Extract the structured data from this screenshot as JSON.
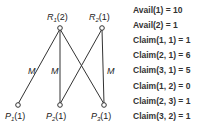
{
  "graph": {
    "resources": [
      {
        "name": "R",
        "index": "1",
        "units": "(2)",
        "x": 60,
        "y": 28
      },
      {
        "name": "R",
        "index": "2",
        "units": "(1)",
        "x": 102,
        "y": 28
      }
    ],
    "processes": [
      {
        "name": "P",
        "index": "1",
        "units": "(1)",
        "x": 18,
        "y": 105
      },
      {
        "name": "P",
        "index": "2",
        "units": "(1)",
        "x": 60,
        "y": 105
      },
      {
        "name": "P",
        "index": "3",
        "units": "(1)",
        "x": 104,
        "y": 105
      }
    ],
    "edges": [
      {
        "from": "R1",
        "to": "P1",
        "label": "M"
      },
      {
        "from": "R1",
        "to": "P2",
        "label": "M"
      },
      {
        "from": "R1",
        "to": "P3",
        "label": ""
      },
      {
        "from": "R2",
        "to": "P2",
        "label": ""
      },
      {
        "from": "R2",
        "to": "P3",
        "label": "M"
      }
    ]
  },
  "equations": [
    {
      "text": "Avail(1)     = 10"
    },
    {
      "text": "Avail(2)     = 1"
    },
    {
      "text": "Claim(1, 1) = 1"
    },
    {
      "text": "Claim(2, 1) = 6"
    },
    {
      "text": "Claim(3, 1) = 5"
    },
    {
      "text": "Claim(1, 2) = 0"
    },
    {
      "text": "Claim(2, 3) = 1"
    },
    {
      "text": "Claim(3, 2) = 1"
    }
  ]
}
